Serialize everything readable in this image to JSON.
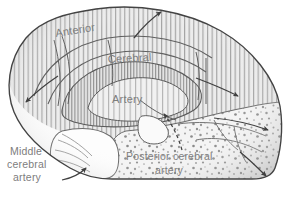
{
  "figure": {
    "background_color": "#ffffff",
    "outline_color": "#4a4a4a",
    "text_color": "#7d7d7d"
  },
  "labels": {
    "anterior": "Anterior",
    "cerebral": "Cerebral",
    "artery": "Artery",
    "middle_line1": "Middle",
    "middle_line2": "cerebral",
    "middle_line3": "artery",
    "posterior_line1": "Posterior cerebral",
    "posterior_line2": "artery"
  },
  "territories": [
    {
      "name": "anterior-cerebral-artery",
      "label": "Anterior Cerebral Artery",
      "pattern": "vertical-hatching",
      "fill_color": "#e8e8e8",
      "hatch_color": "#9a9a9a"
    },
    {
      "name": "middle-cerebral-artery",
      "label": "Middle cerebral artery",
      "pattern": "plain",
      "fill_color": "#fdfdfd",
      "hatch_color": "#a8a8a8"
    },
    {
      "name": "posterior-cerebral-artery",
      "label": "Posterior cerebral artery",
      "pattern": "stipple-dots",
      "fill_color": "#f2f2f2",
      "hatch_color": "#8a8a8a"
    }
  ],
  "arrows": [
    {
      "name": "arrow-top-right",
      "style": "curved-solid",
      "direction": "up-right"
    },
    {
      "name": "arrow-left-edge",
      "style": "straight-solid",
      "direction": "down-left"
    },
    {
      "name": "arrow-right-upper",
      "style": "straight-solid",
      "direction": "down-right"
    },
    {
      "name": "arrow-right-middle",
      "style": "straight-solid",
      "direction": "down-right"
    },
    {
      "name": "arrow-bottom-right",
      "style": "curved-solid",
      "direction": "down-right"
    },
    {
      "name": "arrow-center-dashed",
      "style": "curved-dashed",
      "direction": "up"
    },
    {
      "name": "arrow-middle-cerebral",
      "style": "curved-solid",
      "direction": "right"
    }
  ]
}
